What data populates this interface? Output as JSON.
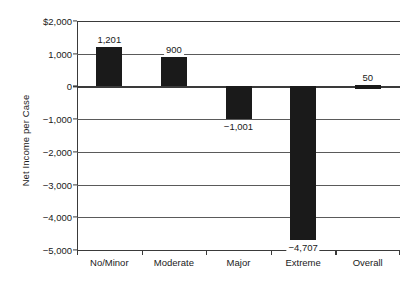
{
  "chart_data": {
    "type": "bar",
    "title": "",
    "xlabel": "",
    "ylabel": "Net Income per Case",
    "categories": [
      "No/Minor",
      "Moderate",
      "Major",
      "Extreme",
      "Overall"
    ],
    "values": [
      1201,
      900,
      -1001,
      -4707,
      50
    ],
    "data_labels": [
      "1,201",
      "900",
      "−1,001",
      "−4,707",
      "50"
    ],
    "ylim": [
      -5000,
      2000
    ],
    "ytick_values": [
      2000,
      1000,
      0,
      -1000,
      -2000,
      -3000,
      -4000,
      -5000
    ],
    "ytick_labels": [
      "$2,000",
      "1,000",
      "0",
      "−1,000",
      "−2,000",
      "−3,000",
      "−4,000",
      "−5,000"
    ],
    "grid": true,
    "legend": "none",
    "bar_color": "#1a1a1a",
    "axis_color": "#3a3a3a",
    "grid_color": "#5a5a5a",
    "background": "#ffffff"
  }
}
